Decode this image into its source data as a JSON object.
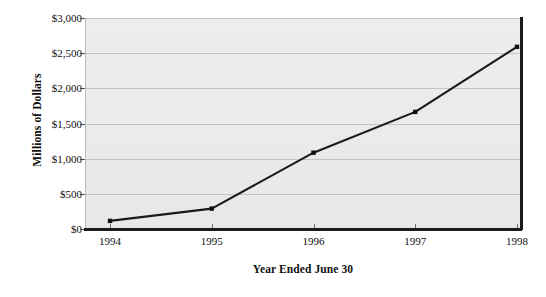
{
  "chart_data": {
    "type": "line",
    "title": "",
    "xlabel": "Year Ended June 30",
    "ylabel": "Millions of Dollars",
    "categories": [
      "1994",
      "1995",
      "1996",
      "1997",
      "1998"
    ],
    "values": [
      115,
      290,
      1085,
      1665,
      2590
    ],
    "series": [
      {
        "name": "Revenue",
        "values": [
          115,
          290,
          1085,
          1665,
          2590
        ]
      }
    ],
    "ylim": [
      0,
      3000
    ],
    "ytick_values": [
      0,
      500,
      1000,
      1500,
      2000,
      2500,
      3000
    ],
    "ytick_labels": [
      "$0",
      "$500",
      "$1,000",
      "$1,500",
      "$2,000",
      "$2,500",
      "$3,000"
    ],
    "xtick_labels": [
      "1994",
      "1995",
      "1996",
      "1997",
      "1998"
    ],
    "grid": "horizontal",
    "legend": "none",
    "colors": {
      "line": "#1a1a1a",
      "marker": "#111111",
      "plot_background": "#eaebeb",
      "gridline": "#c3c4c4",
      "axis": "#1b1b1b",
      "page_background": "#ffffff",
      "text": "#0d0d0d"
    }
  }
}
